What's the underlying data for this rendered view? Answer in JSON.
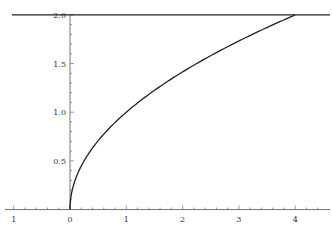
{
  "chart_data": {
    "type": "line",
    "title": "",
    "xlabel": "",
    "ylabel": "",
    "xlim": [
      -1.1,
      4.6
    ],
    "ylim": [
      0,
      2.0
    ],
    "grid": false,
    "legend": null,
    "x_ticks": [
      -1,
      0,
      1,
      2,
      3,
      4
    ],
    "x_tick_labels": [
      "1",
      "0",
      "1",
      "2",
      "3",
      "4"
    ],
    "y_ticks": [
      0.5,
      1.0,
      1.5,
      2.0
    ],
    "y_tick_labels": [
      "0.5",
      "1.0",
      "1.5",
      "2.0"
    ],
    "series": [
      {
        "name": "y = sqrt(x)",
        "x": [
          0,
          0.01,
          0.05,
          0.1,
          0.25,
          0.5,
          1,
          1.5,
          2,
          2.5,
          3,
          3.5,
          4
        ],
        "values": [
          0,
          0.1,
          0.224,
          0.316,
          0.5,
          0.707,
          1.0,
          1.225,
          1.414,
          1.581,
          1.732,
          1.871,
          2.0
        ],
        "color": "#222222"
      },
      {
        "name": "y = 2",
        "x": [
          -1.05,
          4.55
        ],
        "values": [
          2.0,
          2.0
        ],
        "color": "#222222"
      }
    ]
  },
  "colors": {
    "line": "#222222",
    "axis": "#555555",
    "background": "#ffffff"
  }
}
